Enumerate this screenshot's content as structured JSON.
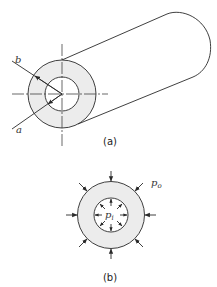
{
  "figure": {
    "panel_a": {
      "caption": "(a)",
      "labels": {
        "outer_radius": "b",
        "inner_radius": "a"
      },
      "description": "Thick-walled cylinder with inner radius a and outer radius b, shown in perspective"
    },
    "panel_b": {
      "caption": "(b)",
      "labels": {
        "outer_pressure": "p",
        "outer_pressure_sub": "o",
        "inner_pressure": "p",
        "inner_pressure_sub": "i"
      },
      "description": "Cross-section under internal pressure pi and external pressure po"
    },
    "colors": {
      "line": "#2a2a2a",
      "fill": "#ececec",
      "background": "#ffffff"
    }
  }
}
